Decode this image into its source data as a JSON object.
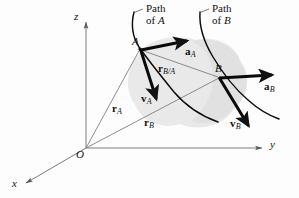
{
  "figure": {
    "type": "vector-diagram",
    "width": 299,
    "height": 198,
    "background_color": "#fdfdfd",
    "ink_color": "#111111",
    "thin_line_color": "#6e6e6e",
    "blob_fill_color": "#e6e6e6"
  },
  "axes": {
    "origin_label": "O",
    "z_label": "z",
    "y_label": "y",
    "x_label": "x",
    "origin_point": {
      "x": 86,
      "y": 148
    },
    "z_tip": {
      "x": 86,
      "y": 18
    },
    "y_tip": {
      "x": 266,
      "y": 148
    },
    "x_tip": {
      "x": 22,
      "y": 186
    }
  },
  "points": [
    {
      "id": "A",
      "label": "A",
      "x": 140,
      "y": 48
    },
    {
      "id": "B",
      "label": "B",
      "x": 220,
      "y": 77
    }
  ],
  "captions": [
    {
      "id": "path-of-a",
      "line1": "Path",
      "line2_prefix": "of ",
      "line2_var": "A"
    },
    {
      "id": "path-of-b",
      "line1": "Path",
      "line2_prefix": "of ",
      "line2_var": "B"
    }
  ],
  "vectors": [
    {
      "id": "r-a",
      "symbol": "r",
      "subscript": "A",
      "from": "O",
      "to": "A",
      "style": "thin",
      "label": "r_A"
    },
    {
      "id": "r-b",
      "symbol": "r",
      "subscript": "B",
      "from": "O",
      "to": "B",
      "style": "thin",
      "label": "r_B"
    },
    {
      "id": "r-b-a",
      "symbol": "r",
      "subscript": "B/A",
      "from": "A",
      "to": "B",
      "style": "thin",
      "label": "r_B/A"
    },
    {
      "id": "a-a",
      "symbol": "a",
      "subscript": "A",
      "from": "A",
      "to": "tangent-accel-A",
      "style": "bold",
      "label": "a_A"
    },
    {
      "id": "v-a",
      "symbol": "v",
      "subscript": "A",
      "from": "A",
      "to": "tangent-vel-A",
      "style": "bold",
      "label": "v_A"
    },
    {
      "id": "a-b",
      "symbol": "a",
      "subscript": "B",
      "from": "B",
      "to": "tangent-accel-B",
      "style": "bold",
      "label": "a_B"
    },
    {
      "id": "v-b",
      "symbol": "v",
      "subscript": "B",
      "from": "B",
      "to": "tangent-vel-B",
      "style": "bold",
      "label": "v_B"
    }
  ],
  "labels": {
    "z": "z",
    "y": "y",
    "x": "x",
    "O": "O",
    "A": "A",
    "B": "B",
    "path_word": "Path",
    "of_word": "of ",
    "a_sym": "a",
    "v_sym": "v",
    "r_sym": "r",
    "sub_A": "A",
    "sub_B": "B",
    "sub_BA": "B/A"
  }
}
